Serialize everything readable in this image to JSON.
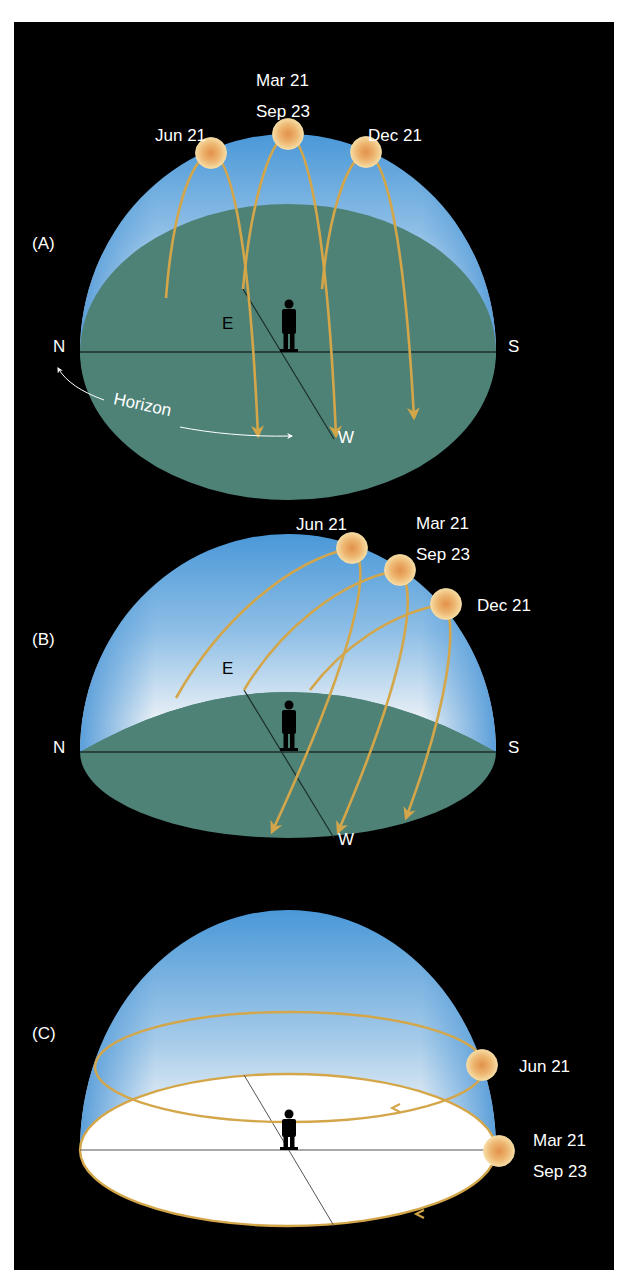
{
  "figure": {
    "background": "#000000",
    "colors": {
      "sky_top": "#4a98d8",
      "sky_bottom": "#eef3f8",
      "ground": "#4e8277",
      "ground_white": "#ffffff",
      "sun_path": "#d4a64a",
      "sun_fill": "#f1c98a",
      "sun_core": "#e29a52"
    },
    "panels": [
      {
        "id": "A",
        "label": "(A)",
        "suns": [
          {
            "date": "Jun 21"
          },
          {
            "date_line1": "Mar 21",
            "date_line2": "Sep 23"
          },
          {
            "date": "Dec 21"
          }
        ],
        "directions": {
          "north": "N",
          "south": "S",
          "east": "E",
          "west": "W"
        },
        "horizon_label": "Horizon"
      },
      {
        "id": "B",
        "label": "(B)",
        "suns": [
          {
            "date": "Jun 21"
          },
          {
            "date_line1": "Mar 21",
            "date_line2": "Sep 23"
          },
          {
            "date": "Dec 21"
          }
        ],
        "directions": {
          "north": "N",
          "south": "S",
          "east": "E",
          "west": "W"
        }
      },
      {
        "id": "C",
        "label": "(C)",
        "suns": [
          {
            "date": "Jun 21"
          },
          {
            "date_line1": "Mar 21",
            "date_line2": "Sep 23"
          }
        ]
      }
    ]
  }
}
